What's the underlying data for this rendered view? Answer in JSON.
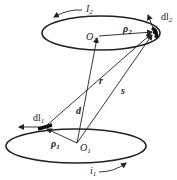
{
  "diagram": {
    "colors": {
      "stroke": "#222222",
      "background": "#ffffff"
    },
    "loops": [
      {
        "id": "loop-2",
        "center_label": "O",
        "center_sub": "2",
        "current_label": "I",
        "current_sub": "2",
        "element_label": "dl",
        "element_sub": "2",
        "radius_label": "ρ",
        "radius_sub": "2"
      },
      {
        "id": "loop-1",
        "center_label": "O",
        "center_sub": "1",
        "current_label": "i",
        "current_sub": "1",
        "element_label": "dl",
        "element_sub": "1",
        "radius_label": "ρ",
        "radius_sub": "1"
      }
    ],
    "vectors": {
      "r": "r",
      "d": "d",
      "s": "s"
    }
  }
}
